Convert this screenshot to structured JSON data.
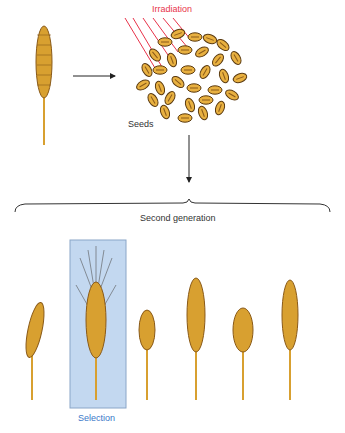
{
  "labels": {
    "irradiation": "Irradiation",
    "seeds": "Seeds",
    "second_generation": "Second generation",
    "selection": "Selection"
  },
  "colors": {
    "irradiation": "#e8334a",
    "selection_box": "#c3d8f0",
    "selection_text": "#3a78c8",
    "wheat": "#d8a030",
    "seed": "#e8b040"
  }
}
